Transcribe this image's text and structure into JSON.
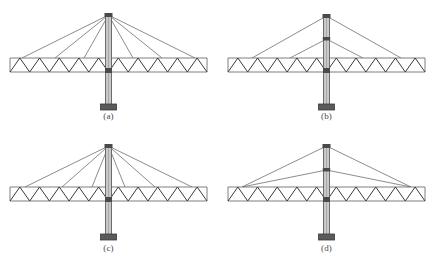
{
  "figure": {
    "background_color": "#ffffff",
    "panel_count": 4,
    "colors": {
      "chord": "#6f6f6f",
      "web_member": "#3a3a3a",
      "cable": "#5a5a5a",
      "pylon_fill": "#c9c9c9",
      "pylon_edge": "#5e5e5e",
      "node": "#4a4a4a",
      "footing": "#5a5a5a",
      "caption_text": "#4a4a4a"
    }
  },
  "panels": [
    {
      "id": "a",
      "caption": "(a)",
      "description": "Fan cable-stay system: all stays converge at a single point at the pylon top and anchor at spread points along the truss deck.",
      "cable_anchor_levels_on_pylon": 1,
      "cables_per_side": 3,
      "deck_anchor_style": "spread",
      "truss_type": "Warren truss",
      "truss_panels_per_half": 5,
      "pylon_above_deck": true,
      "pylon_below_deck": true,
      "has_footing": true
    },
    {
      "id": "b",
      "caption": "(b)",
      "description": "Two-level harp-like stay system: stays anchor at two separate heights on the pylon and spread to the truss deck.",
      "cable_anchor_levels_on_pylon": 2,
      "cables_per_side": 2,
      "deck_anchor_style": "spread",
      "truss_type": "Warren truss",
      "truss_panels_per_half": 5,
      "pylon_above_deck": true,
      "pylon_below_deck": true,
      "has_footing": true
    },
    {
      "id": "c",
      "caption": "(c)",
      "description": "Fan cable-stay system with steeper stays converging at the pylon top and anchoring at spread deck points.",
      "cable_anchor_levels_on_pylon": 1,
      "cables_per_side": 3,
      "deck_anchor_style": "spread",
      "truss_type": "Warren truss",
      "truss_panels_per_half": 5,
      "pylon_above_deck": true,
      "pylon_below_deck": true,
      "has_footing": true
    },
    {
      "id": "d",
      "caption": "(d)",
      "description": "Two-level stay system converging to a single anchorage point near each end of the truss deck.",
      "cable_anchor_levels_on_pylon": 2,
      "cables_per_side": 2,
      "deck_anchor_style": "converged-at-end",
      "truss_type": "Warren truss",
      "truss_panels_per_half": 5,
      "pylon_above_deck": true,
      "pylon_below_deck": true,
      "has_footing": true
    }
  ],
  "geometry": {
    "deck_left_x": 10,
    "deck_right_x": 207,
    "deck_top_y": 58,
    "deck_bottom_y": 72,
    "pylon_center_x": 108.5,
    "pylon_top_y": 14,
    "pylon_base_y": 104,
    "footing_y": 104,
    "footing_width": 16,
    "footing_height": 6
  }
}
